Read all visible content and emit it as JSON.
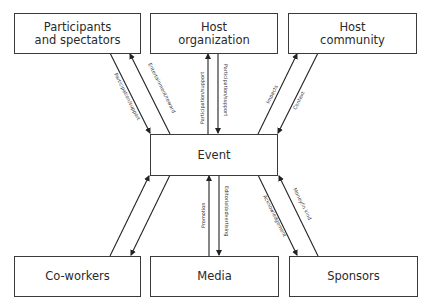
{
  "nodes": {
    "participants": {
      "label": "Participants\nand spectators",
      "line1": "Participants",
      "line2": "and spectators"
    },
    "host_org": {
      "label": "Host organization",
      "line1": "Host",
      "line2": "organization"
    },
    "host_community": {
      "label": "Host community",
      "line1": "Host",
      "line2": "community"
    },
    "event": {
      "label": "Event"
    },
    "coworkers": {
      "label": "Co-workers"
    },
    "media": {
      "label": "Media"
    },
    "sponsors": {
      "label": "Sponsors"
    }
  },
  "edges": [
    {
      "from": "participants",
      "to": "event",
      "label": "Participation/support"
    },
    {
      "from": "event",
      "to": "participants",
      "label": "Entertainment/reward"
    },
    {
      "from": "event",
      "to": "host_org",
      "label": "Participation/support"
    },
    {
      "from": "host_org",
      "to": "event",
      "label": "Participation/support"
    },
    {
      "from": "event",
      "to": "host_community",
      "label": "Impacts"
    },
    {
      "from": "host_community",
      "to": "event",
      "label": "Context"
    },
    {
      "from": "coworkers",
      "to": "event",
      "label": ""
    },
    {
      "from": "event",
      "to": "coworkers",
      "label": ""
    },
    {
      "from": "media",
      "to": "event",
      "label": "Promotion"
    },
    {
      "from": "event",
      "to": "media",
      "label": "Editorial/advertising"
    },
    {
      "from": "event",
      "to": "sponsors",
      "label": "Acknowledgement"
    },
    {
      "from": "sponsors",
      "to": "event",
      "label": "Money/in kind"
    }
  ]
}
